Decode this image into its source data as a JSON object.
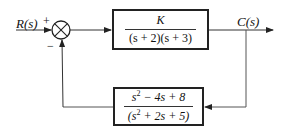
{
  "diagram": {
    "type": "negative-feedback block diagram",
    "input": {
      "label": "R(s)"
    },
    "output": {
      "label": "C(s)"
    },
    "summing_junction": {
      "plus_sign": "+",
      "minus_sign": "−"
    },
    "forward_block": {
      "numerator": "K",
      "denominator": "(s + 2)(s + 3)"
    },
    "feedback_block": {
      "numerator_parts": {
        "base": "s",
        "exp": "2",
        "rest": " − 4s + 8"
      },
      "denominator_parts": {
        "open": "(s",
        "exp": "2",
        "rest": " + 2s + 5)"
      }
    },
    "colors": {
      "line": "#222222",
      "background": "#ffffff"
    }
  }
}
